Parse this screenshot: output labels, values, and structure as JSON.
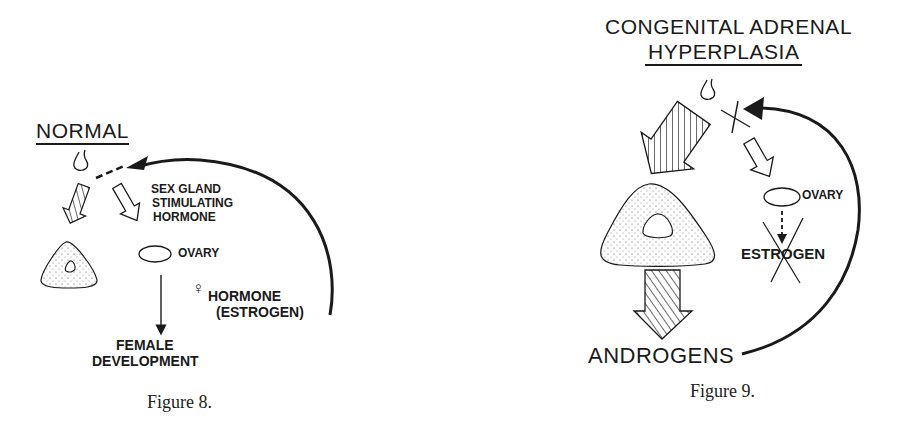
{
  "figures": [
    {
      "id": "fig8",
      "title": "NORMAL",
      "caption": "Figure 8.",
      "labels": {
        "sex_gland_line1": "SEX GLAND",
        "sex_gland_line2": "STIMULATING",
        "sex_gland_line3": "HORMONE",
        "ovary": "OVARY",
        "female_symbol": "♀",
        "hormone_line1": "HORMONE",
        "hormone_line2": "(ESTROGEN)",
        "outcome_line1": "FEMALE",
        "outcome_line2": "DEVELOPMENT"
      }
    },
    {
      "id": "fig9",
      "title_line1": "CONGENITAL ADRENAL",
      "title_line2": "HYPERPLASIA",
      "caption": "Figure 9.",
      "labels": {
        "ovary": "OVARY",
        "estrogen": "ESTROGEN",
        "androgens": "ANDROGENS"
      }
    }
  ],
  "colors": {
    "ink": "#1a1a1a",
    "background": "#ffffff"
  }
}
